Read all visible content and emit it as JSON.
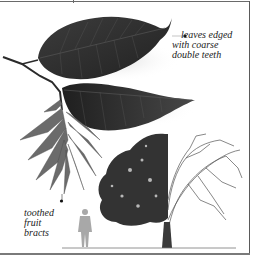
{
  "document": {
    "type": "field-guide-illustration",
    "annotations": [
      {
        "id": "leaves",
        "lines": [
          "leaves edged",
          "with coarse",
          "double teeth"
        ]
      },
      {
        "id": "bracts",
        "lines": [
          "toothed",
          "fruit",
          "bracts"
        ]
      }
    ]
  },
  "illustration": {
    "subjects": [
      "leafy-branch",
      "fruit-bract-cluster",
      "tree-summer-winter-split",
      "human-scale-figure"
    ]
  },
  "colors": {
    "leaf_dark": "#2e2e2e",
    "leaf_mid": "#4a4a4a",
    "bract": "#6f6f6f",
    "tree_foliage": "#3a3a3a",
    "branches": "#555555",
    "figure": "#a8a8a8",
    "frame": "#6a6a6a"
  }
}
